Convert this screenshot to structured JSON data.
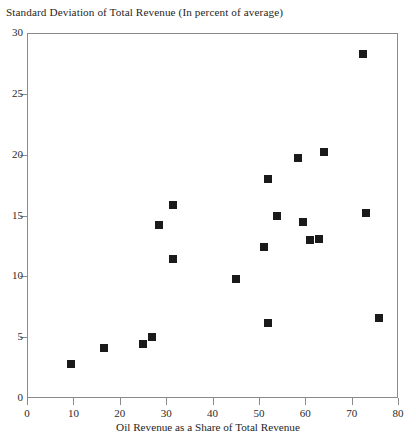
{
  "chart_data": {
    "type": "scatter",
    "title": "Standard Deviation of Total Revenue (In percent of average)",
    "xlabel": "Oil Revenue as a Share of Total Revenue",
    "ylabel": "",
    "xlim": [
      0,
      80
    ],
    "ylim": [
      0,
      30
    ],
    "xticks": [
      0,
      10,
      20,
      30,
      40,
      50,
      60,
      70,
      80
    ],
    "yticks": [
      0,
      5,
      10,
      15,
      20,
      25,
      30
    ],
    "grid": false,
    "legend": null,
    "marker": "square",
    "marker_color": "#1a1a1a",
    "points": [
      {
        "x": 9.5,
        "y": 2.8
      },
      {
        "x": 16.5,
        "y": 4.1
      },
      {
        "x": 25.0,
        "y": 4.4
      },
      {
        "x": 27.0,
        "y": 5.0
      },
      {
        "x": 28.5,
        "y": 14.2
      },
      {
        "x": 31.5,
        "y": 15.9
      },
      {
        "x": 31.5,
        "y": 11.4
      },
      {
        "x": 45.0,
        "y": 9.8
      },
      {
        "x": 51.0,
        "y": 12.4
      },
      {
        "x": 52.0,
        "y": 18.0
      },
      {
        "x": 52.0,
        "y": 6.2
      },
      {
        "x": 54.0,
        "y": 15.0
      },
      {
        "x": 58.5,
        "y": 19.7
      },
      {
        "x": 59.5,
        "y": 14.5
      },
      {
        "x": 61.0,
        "y": 13.0
      },
      {
        "x": 63.0,
        "y": 13.1
      },
      {
        "x": 64.0,
        "y": 20.2
      },
      {
        "x": 72.5,
        "y": 28.3
      },
      {
        "x": 73.0,
        "y": 15.2
      },
      {
        "x": 76.0,
        "y": 6.6
      }
    ]
  },
  "axes": {
    "x_tick_labels": [
      "0",
      "10",
      "20",
      "30",
      "40",
      "50",
      "60",
      "70",
      "80"
    ],
    "y_tick_labels": [
      "0",
      "5",
      "10",
      "15",
      "20",
      "25",
      "30"
    ]
  }
}
